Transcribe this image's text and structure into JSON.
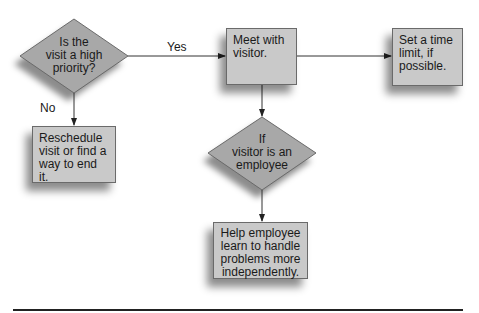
{
  "diagram": {
    "type": "flowchart",
    "nodes": {
      "priority": {
        "shape": "diamond",
        "text_lines": [
          "Is the",
          "visit a high",
          "priority?"
        ]
      },
      "meet": {
        "shape": "box",
        "text": "Meet with visitor."
      },
      "time_limit": {
        "shape": "box",
        "text": "Set a time limit, if possible."
      },
      "reschedule": {
        "shape": "box",
        "text": "Reschedule visit or find a way to end it."
      },
      "employee": {
        "shape": "diamond",
        "text_lines": [
          "If",
          "visitor is an",
          "employee"
        ]
      },
      "help": {
        "shape": "box",
        "text": "Help employee learn to handle problems more independently."
      }
    },
    "edges": {
      "yes_label": "Yes",
      "no_label": "No"
    },
    "colors": {
      "fill": "#c9c9c9",
      "diamond_fill": "#a8a8a8",
      "stroke": "#6a6a6a",
      "line": "#333333"
    }
  }
}
